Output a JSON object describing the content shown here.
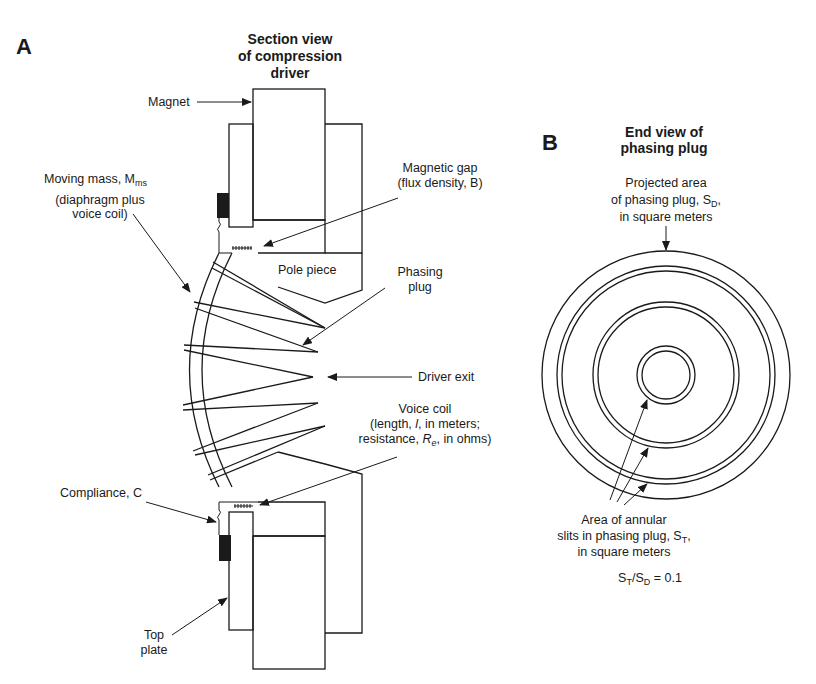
{
  "panel_a": {
    "letter": "A",
    "title_lines": [
      "Section view",
      "of compression",
      "driver"
    ],
    "labels": {
      "magnet": "Magnet",
      "moving_mass_line1_main": "Moving mass, M",
      "moving_mass_line1_sub": "ms",
      "moving_mass_line2": "(diaphragm plus",
      "moving_mass_line3": "voice coil)",
      "magnetic_gap_line1": "Magnetic gap",
      "magnetic_gap_line2": "(flux density, B)",
      "pole_piece": "Pole piece",
      "phasing_plug_line1": "Phasing",
      "phasing_plug_line2": "plug",
      "driver_exit": "Driver exit",
      "voice_coil_line1": "Voice coil",
      "voice_coil_line2_a": "(length, ",
      "voice_coil_line2_var": "l",
      "voice_coil_line2_b": ", in meters;",
      "voice_coil_line3_a": "resistance, ",
      "voice_coil_line3_var": "R",
      "voice_coil_line3_sub": "e",
      "voice_coil_line3_b": ", in ohms)",
      "compliance": "Compliance, C",
      "top_plate_line1": "Top",
      "top_plate_line2": "plate"
    }
  },
  "panel_b": {
    "letter": "B",
    "title_lines": [
      "End view  of",
      "phasing plug"
    ],
    "labels": {
      "projected_line1": "Projected area",
      "projected_line2_main": "of phasing plug, S",
      "projected_line2_sub": "D",
      "projected_line2_end": ",",
      "projected_line3": "in square meters",
      "annular_line1": "Area of annular",
      "annular_line2_main": "slits in phasing plug, S",
      "annular_line2_sub": "T",
      "annular_line2_end": ",",
      "annular_line3": "in square meters",
      "ratio_s1": "S",
      "ratio_sub1": "T",
      "ratio_mid": "/S",
      "ratio_sub2": "D",
      "ratio_end": " = 0.1"
    }
  },
  "colors": {
    "ink": "#1a1a1a",
    "background": "#ffffff"
  }
}
